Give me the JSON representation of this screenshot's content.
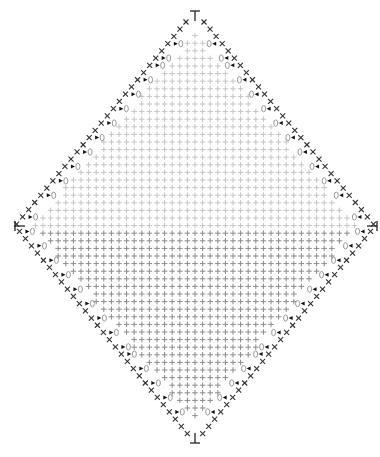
{
  "diagram": {
    "type": "crochet-chart",
    "shape": "diamond",
    "width": 380,
    "height": 457,
    "center_x": 195,
    "top_y": 16,
    "mid_y": 226,
    "bottom_y": 438,
    "left_x": 20,
    "right_x": 372,
    "cell": 7.6,
    "colors": {
      "upper_stitch": "#c4c4c4",
      "lower_stitch": "#8a8a8a",
      "edge_x": "#333333",
      "marker": "#111111",
      "chain_oval": "#9a9a9a"
    },
    "symbols": {
      "single_crochet": "+",
      "edge_stitch": "x",
      "chain": "oval",
      "fasten_marker": "triangle",
      "turning": "T"
    }
  }
}
